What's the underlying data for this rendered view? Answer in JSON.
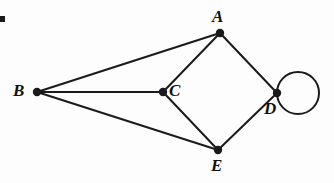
{
  "figure": {
    "width": 334,
    "height": 183,
    "background_color": "#fdfdfd",
    "ink_color": "#1a1a1a",
    "type": "undirected-graph-diagram",
    "corner_mark": {
      "x": 0,
      "y": 16,
      "width": 5,
      "height": 6
    }
  },
  "chart_data": {
    "type": "diagram",
    "subtype": "graph",
    "title": "",
    "nodes": [
      {
        "id": "A",
        "label": "A",
        "x": 220,
        "y": 33,
        "radius": 4.2,
        "label_x": 212,
        "label_y": 8,
        "degree": 3
      },
      {
        "id": "B",
        "label": "B",
        "x": 37,
        "y": 92,
        "radius": 4.2,
        "label_x": 13,
        "label_y": 82,
        "degree": 3
      },
      {
        "id": "C",
        "label": "C",
        "x": 163,
        "y": 92,
        "radius": 4.2,
        "label_x": 169,
        "label_y": 82,
        "degree": 3
      },
      {
        "id": "D",
        "label": "D",
        "x": 277,
        "y": 93,
        "radius": 4.2,
        "label_x": 264,
        "label_y": 100,
        "degree": 4
      },
      {
        "id": "E",
        "label": "E",
        "x": 218,
        "y": 150,
        "radius": 4.2,
        "label_x": 211,
        "label_y": 157,
        "degree": 3
      }
    ],
    "edges": [
      {
        "from": "B",
        "to": "A",
        "kind": "line"
      },
      {
        "from": "B",
        "to": "C",
        "kind": "line"
      },
      {
        "from": "B",
        "to": "E",
        "kind": "line"
      },
      {
        "from": "A",
        "to": "C",
        "kind": "line"
      },
      {
        "from": "A",
        "to": "D",
        "kind": "line"
      },
      {
        "from": "C",
        "to": "E",
        "kind": "line"
      },
      {
        "from": "E",
        "to": "D",
        "kind": "line"
      },
      {
        "from": "D",
        "to": "D",
        "kind": "self-loop",
        "loop_center_x": 298,
        "loop_center_y": 93,
        "loop_radius": 21
      }
    ],
    "edge_count": 8,
    "node_count": 5,
    "has_self_loop": true,
    "stroke_width": 2
  }
}
